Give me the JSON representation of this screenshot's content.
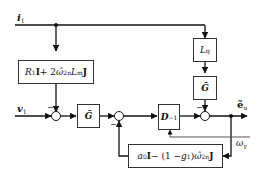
{
  "diagram": {
    "type": "block-diagram",
    "inputs": {
      "i1": {
        "symbol": "i",
        "subscript": "1"
      },
      "v1": {
        "symbol": "v",
        "subscript": "1"
      }
    },
    "outputs": {
      "e_u": {
        "symbol": "ẽ",
        "subscript": "u"
      },
      "omega_gamma": {
        "symbol": "ω",
        "subscript": "γ"
      }
    },
    "blocks": {
      "resistance": {
        "label": "R₁I + 2ω̂₂ₙLₘJ",
        "parts": [
          "R",
          "1",
          "I",
          " + 2",
          "ω̂",
          "2n",
          "L",
          "m",
          "J"
        ]
      },
      "Lq": {
        "symbol": "L",
        "subscript": "q"
      },
      "G_tilde_top": {
        "symbol": "G̃"
      },
      "G_tilde_mid": {
        "symbol": "G̃"
      },
      "D_inv": {
        "symbol": "D",
        "superscript": "−1"
      },
      "feedback": {
        "label": "a₀I − (1 − g₁)ω̂₂ₙJ",
        "parts": [
          "a",
          "0",
          "I",
          " − (1 − ",
          "g",
          "1",
          ")",
          "ω̂",
          "2n",
          "J"
        ]
      }
    },
    "summing_junction_signs": [
      "−",
      "−",
      "−"
    ]
  }
}
